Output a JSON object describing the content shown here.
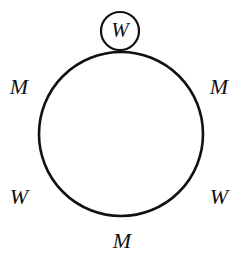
{
  "figure": {
    "background_color": "#ffffff",
    "stroke_color": "#111111",
    "canvas": {
      "width": 248,
      "height": 263
    },
    "main_circle": {
      "name": "table-circle",
      "center_x": 121,
      "center_y": 134,
      "radius": 82,
      "stroke_width": 2.6,
      "fill": "none"
    },
    "highlight_circle": {
      "name": "highlighted-seat-circle",
      "center_x": 120,
      "center_y": 31,
      "radius": 19,
      "stroke_width": 2.2,
      "fill": "#ffffff",
      "label": "W"
    },
    "seats": [
      {
        "id": "top",
        "label": "W",
        "position": "top",
        "circled": true,
        "x": 120,
        "y": 31
      },
      {
        "id": "left-upper",
        "label": "M",
        "position": "upper-left",
        "circled": false,
        "x": 19,
        "y": 87
      },
      {
        "id": "right-upper",
        "label": "M",
        "position": "upper-right",
        "circled": false,
        "x": 219,
        "y": 87
      },
      {
        "id": "left-lower",
        "label": "W",
        "position": "lower-left",
        "circled": false,
        "x": 19,
        "y": 197
      },
      {
        "id": "right-lower",
        "label": "W",
        "position": "lower-right",
        "circled": false,
        "x": 219,
        "y": 197
      },
      {
        "id": "bottom",
        "label": "M",
        "position": "bottom",
        "circled": false,
        "x": 122,
        "y": 241
      }
    ],
    "legend": {
      "m_meaning": "M",
      "w_meaning": "W"
    }
  }
}
